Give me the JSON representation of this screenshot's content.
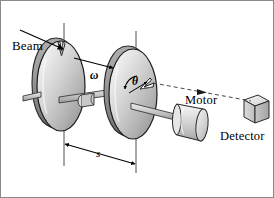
{
  "figure": {
    "type": "technical-line-diagram",
    "width": 274,
    "height": 198,
    "background_color": "#ffffff",
    "border_color": "#8a8a8a",
    "ink_color": "#000000"
  },
  "labels": {
    "beam": "Beam",
    "motor": "Motor",
    "detector": "Detector",
    "omega": "ω",
    "theta": "θ",
    "separation": "s"
  },
  "annotations": {
    "beam_arrow": {
      "name": "beam-arrow",
      "description": "solid arrow from upper-left pointing down-right into the first disc notch"
    },
    "omega_arrow": {
      "name": "omega-rotation-arrow",
      "description": "solid arrow pointing right along the shaft indicating angular velocity"
    },
    "theta_arc": {
      "name": "theta-angle-arc",
      "description": "small arc with arrowheads on the second disc between the vertical axis and the notch"
    },
    "separation_dimension": {
      "name": "separation-dimension-line",
      "description": "double-headed dimension arrow between the two vertical axis lines labelled s"
    },
    "detector_ray": {
      "name": "detector-dashed-ray",
      "description": "dashed line with arrowhead from the second disc notch to the detector cube"
    }
  },
  "parts": {
    "disc_front": {
      "name": "rotating-disc-front",
      "fill_light": "#f2f2f2",
      "fill_mid": "#c9c9c9",
      "fill_dark": "#8e8e8e"
    },
    "disc_back": {
      "name": "rotating-disc-back",
      "fill_light": "#f2f2f2",
      "fill_mid": "#c9c9c9",
      "fill_dark": "#8e8e8e"
    },
    "shaft": {
      "name": "drive-shaft",
      "fill": "#c4c4c4"
    },
    "motor_body": {
      "name": "motor-cylinder",
      "fill": "#d8d8d8"
    },
    "detector_box": {
      "name": "detector-cube",
      "fill": "#d5d5d5"
    },
    "axis_front": {
      "name": "axis-line-front"
    },
    "axis_back": {
      "name": "axis-line-back"
    }
  }
}
